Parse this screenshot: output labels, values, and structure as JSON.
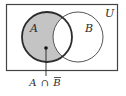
{
  "diagram": {
    "type": "venn",
    "universe_label": "U",
    "sets": [
      {
        "label": "A",
        "shaded": "difference_only"
      },
      {
        "label": "B",
        "shaded": "none"
      }
    ],
    "shaded_region": "A minus B",
    "annotation": {
      "part1": "A",
      "operator": "∩",
      "part2": "B",
      "part2_overline": true
    },
    "colors": {
      "shade": "#c4c4c4",
      "stroke_a": "#2b2b2b",
      "stroke_b": "#555555",
      "frame": "#444444"
    }
  }
}
